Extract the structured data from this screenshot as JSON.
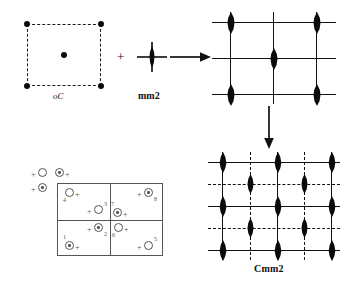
{
  "figure": {
    "title_hidden": "",
    "labels": {
      "lattice_label": "oC",
      "point_group_label": "mm2",
      "space_group_label": "Cmm2",
      "operator_plus": "+",
      "arrow_right": "arrow-right",
      "arrow_down": "arrow-down"
    }
  },
  "lattice_cell": {
    "name": "oC",
    "label": "oC",
    "border_style": "dashed",
    "node_color": "#0b0b0b",
    "nodes": [
      {
        "id": "corner-tl",
        "x": 0,
        "y": 0
      },
      {
        "id": "corner-tr",
        "x": 100,
        "y": 0
      },
      {
        "id": "corner-bl",
        "x": 0,
        "y": 100
      },
      {
        "id": "corner-br",
        "x": 100,
        "y": 100
      },
      {
        "id": "center-c",
        "x": 50,
        "y": 50
      }
    ]
  },
  "point_group": {
    "label": "mm2",
    "symbol": "two-fold-axis-with-mirrors",
    "lens_color": "#0b0b0b"
  },
  "top_lattice": {
    "name": "oC-lattice-with-mm2",
    "line_color": "#111111",
    "columns": [
      0,
      50,
      100
    ],
    "rows": [
      0,
      50,
      100
    ],
    "line_styles": {
      "horizontal": [
        "solid",
        "solid",
        "solid"
      ],
      "vertical": [
        "solid",
        "solid",
        "solid"
      ]
    },
    "axes": [
      {
        "col": 0,
        "row": 0
      },
      {
        "col": 2,
        "row": 0
      },
      {
        "col": 1,
        "row": 1
      },
      {
        "col": 0,
        "row": 2
      },
      {
        "col": 2,
        "row": 2
      }
    ]
  },
  "bottom_lattice": {
    "name": "Cmm2-space-group-diagram",
    "label": "Cmm2",
    "line_color": "#111111",
    "columns": [
      0,
      25,
      50,
      75,
      100
    ],
    "rows": [
      0,
      25,
      50,
      75,
      100
    ],
    "line_styles": {
      "horizontal": [
        "solid",
        "dashed",
        "solid",
        "dashed",
        "solid"
      ],
      "vertical": [
        "solid",
        "dashed",
        "solid",
        "dashed",
        "solid"
      ]
    },
    "axes": [
      {
        "col": 0,
        "row": 0
      },
      {
        "col": 2,
        "row": 0
      },
      {
        "col": 4,
        "row": 0
      },
      {
        "col": 1,
        "row": 1
      },
      {
        "col": 3,
        "row": 1
      },
      {
        "col": 0,
        "row": 2
      },
      {
        "col": 2,
        "row": 2
      },
      {
        "col": 4,
        "row": 2
      },
      {
        "col": 1,
        "row": 3
      },
      {
        "col": 3,
        "row": 3
      },
      {
        "col": 0,
        "row": 4
      },
      {
        "col": 2,
        "row": 4
      },
      {
        "col": 4,
        "row": 4
      }
    ]
  },
  "general_positions": {
    "name": "general-position-diagram",
    "border_color": "#555555",
    "outside_points": [
      {
        "id": "out-a",
        "type": "open",
        "sign": "+",
        "sign_side": "left",
        "x": -24,
        "y": -14,
        "label": ""
      },
      {
        "id": "out-b",
        "type": "dotted",
        "sign": "+",
        "sign_side": "right",
        "x": -5,
        "y": -14,
        "label": ""
      },
      {
        "id": "out-c",
        "type": "dotted",
        "sign": "+",
        "sign_side": "left",
        "x": -24,
        "y": 2,
        "label": ""
      }
    ],
    "points": [
      {
        "id": "p4",
        "num": "4",
        "type": "open",
        "sign": "+",
        "sign_side": "right",
        "x": 8,
        "y": 6,
        "quadrant": "top-left"
      },
      {
        "id": "p3",
        "num": "3",
        "type": "open",
        "sign": "+",
        "sign_side": "left",
        "x": 40,
        "y": 27,
        "quadrant": "top-left"
      },
      {
        "id": "p7",
        "num": "7",
        "type": "dotted",
        "sign": "+",
        "sign_side": "right",
        "x": 58,
        "y": 29,
        "quadrant": "top-right"
      },
      {
        "id": "p8",
        "num": "8",
        "type": "dotted",
        "sign": "+",
        "sign_side": "left",
        "x": 84,
        "y": 8,
        "quadrant": "top-right"
      },
      {
        "id": "p2",
        "num": "2",
        "type": "dotted",
        "sign": "+",
        "sign_side": "left",
        "x": 40,
        "y": 52,
        "quadrant": "bottom-left"
      },
      {
        "id": "p1",
        "num": "1",
        "type": "dotted",
        "sign": "+",
        "sign_side": "right",
        "x": 8,
        "y": 73,
        "quadrant": "bottom-left"
      },
      {
        "id": "p6",
        "num": "6",
        "type": "open",
        "sign": "+",
        "sign_side": "right",
        "x": 58,
        "y": 52,
        "quadrant": "bottom-right"
      },
      {
        "id": "p5",
        "num": "5",
        "type": "open",
        "sign": "+",
        "sign_side": "left",
        "x": 86,
        "y": 73,
        "quadrant": "bottom-right"
      }
    ]
  }
}
